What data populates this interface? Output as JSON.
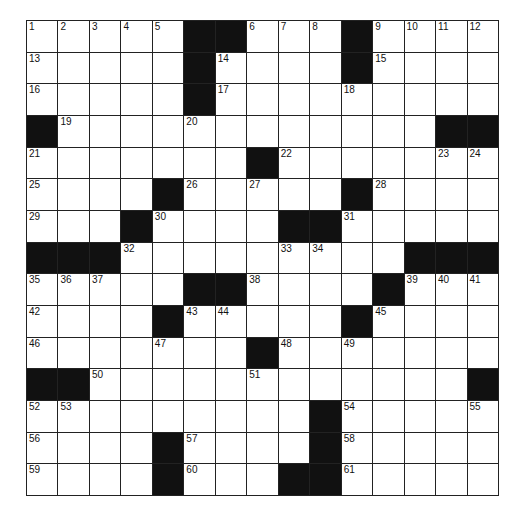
{
  "puzzle": {
    "rows": 15,
    "cols": 15,
    "grid": [
      [
        "1",
        "2",
        "3",
        "4",
        "5",
        "#",
        "#",
        "6",
        "7",
        "8",
        "#",
        "9",
        "10",
        "11",
        "12"
      ],
      [
        "13",
        ".",
        ".",
        ".",
        ".",
        "#",
        "14",
        ".",
        ".",
        ".",
        "#",
        "15",
        ".",
        ".",
        "."
      ],
      [
        "16",
        ".",
        ".",
        ".",
        ".",
        "#",
        "17",
        ".",
        ".",
        ".",
        "18",
        ".",
        ".",
        ".",
        "."
      ],
      [
        "#",
        "19",
        ".",
        ".",
        ".",
        "20",
        ".",
        ".",
        ".",
        ".",
        ".",
        ".",
        ".",
        "#",
        "#"
      ],
      [
        "21",
        ".",
        ".",
        ".",
        ".",
        ".",
        ".",
        "#",
        "22",
        ".",
        ".",
        ".",
        ".",
        "23",
        "24"
      ],
      [
        "25",
        ".",
        ".",
        ".",
        "#",
        "26",
        ".",
        "27",
        ".",
        ".",
        "#",
        "28",
        ".",
        ".",
        "."
      ],
      [
        "29",
        ".",
        ".",
        "#",
        "30",
        ".",
        ".",
        ".",
        "#",
        "#",
        "31",
        ".",
        ".",
        ".",
        "."
      ],
      [
        "#",
        "#",
        "#",
        "32",
        ".",
        ".",
        ".",
        ".",
        "33",
        "34",
        ".",
        ".",
        "#",
        "#",
        "#"
      ],
      [
        "35",
        "36",
        "37",
        ".",
        ".",
        "#",
        "#",
        "38",
        ".",
        ".",
        ".",
        "#",
        "39",
        "40",
        "41"
      ],
      [
        "42",
        ".",
        ".",
        ".",
        "#",
        "43",
        "44",
        ".",
        ".",
        ".",
        "#",
        "45",
        ".",
        ".",
        "."
      ],
      [
        "46",
        ".",
        ".",
        ".",
        "47",
        ".",
        ".",
        "#",
        "48",
        ".",
        "49",
        ".",
        ".",
        ".",
        "."
      ],
      [
        "#",
        "#",
        "50",
        ".",
        ".",
        ".",
        ".",
        "51",
        ".",
        ".",
        ".",
        ".",
        ".",
        ".",
        "#"
      ],
      [
        "52",
        "53",
        ".",
        ".",
        ".",
        ".",
        ".",
        ".",
        ".",
        "#",
        "54",
        ".",
        ".",
        ".",
        "55"
      ],
      [
        "56",
        ".",
        ".",
        ".",
        "#",
        "57",
        ".",
        ".",
        ".",
        "#",
        "58",
        ".",
        ".",
        ".",
        "."
      ],
      [
        "59",
        ".",
        ".",
        ".",
        "#",
        "60",
        ".",
        ".",
        "#",
        "#",
        "61",
        ".",
        ".",
        ".",
        "."
      ]
    ]
  }
}
